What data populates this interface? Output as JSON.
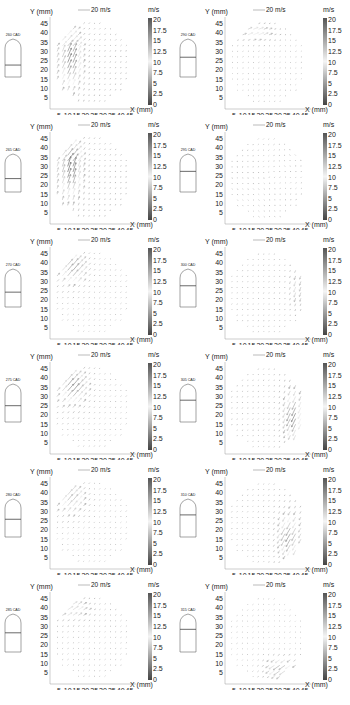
{
  "figure": {
    "axis_labels": {
      "y": "Y (mm)",
      "x": "X (mm)"
    },
    "scale_vector_label": "20 m/s",
    "colorbar": {
      "unit": "m/s",
      "ticks": [
        "20",
        "17.5",
        "15",
        "12.5",
        "10",
        "7.5",
        "5",
        "2.5",
        "0"
      ],
      "range": [
        0,
        20
      ],
      "colors": {
        "top": "#555555",
        "mid": "#f4f4f4",
        "bottom": "#444444"
      }
    },
    "x_ticks": [
      "5",
      "10",
      "15",
      "20",
      "25",
      "30",
      "35",
      "40",
      "45"
    ],
    "y_ticks": [
      "45",
      "40",
      "35",
      "30",
      "25",
      "20",
      "15",
      "10",
      "5"
    ]
  },
  "chart_data": [
    {
      "type": "vector_field",
      "title": "260 CAD",
      "crank_angle": 260,
      "piston_position": 0.55,
      "high_velocity_region": "left side, upward swirl along left wall (x 5-20 mm, y 10-40 mm)",
      "max_velocity_m_s": 18,
      "xlabel": "X (mm)",
      "ylabel": "Y (mm)",
      "xlim": [
        0,
        47
      ],
      "ylim": [
        0,
        47
      ],
      "clim": [
        0,
        20
      ]
    },
    {
      "type": "vector_field",
      "title": "265 CAD",
      "crank_angle": 265,
      "piston_position": 0.6,
      "high_velocity_region": "left side, upward flow along left wall (x 5-20 mm, y 15-42 mm)",
      "max_velocity_m_s": 18,
      "xlabel": "X (mm)",
      "ylabel": "Y (mm)",
      "xlim": [
        0,
        47
      ],
      "ylim": [
        0,
        47
      ],
      "clim": [
        0,
        20
      ]
    },
    {
      "type": "vector_field",
      "title": "270 CAD",
      "crank_angle": 270,
      "piston_position": 0.65,
      "high_velocity_region": "upper-left (x 5-20 mm, y 28-44 mm)",
      "max_velocity_m_s": 16,
      "xlabel": "X (mm)",
      "ylabel": "Y (mm)",
      "xlim": [
        0,
        47
      ],
      "ylim": [
        0,
        47
      ],
      "clim": [
        0,
        20
      ]
    },
    {
      "type": "vector_field",
      "title": "275 CAD",
      "crank_angle": 275,
      "piston_position": 0.7,
      "high_velocity_region": "upper-left diagonal flow (x 5-20 mm, y 25-45 mm)",
      "max_velocity_m_s": 17,
      "xlabel": "X (mm)",
      "ylabel": "Y (mm)",
      "xlim": [
        0,
        47
      ],
      "ylim": [
        0,
        47
      ],
      "clim": [
        0,
        20
      ]
    },
    {
      "type": "vector_field",
      "title": "280 CAD",
      "crank_angle": 280,
      "piston_position": 0.75,
      "high_velocity_region": "upper-left (x 5-18 mm, y 28-44 mm)",
      "max_velocity_m_s": 14,
      "xlabel": "X (mm)",
      "ylabel": "Y (mm)",
      "xlim": [
        0,
        47
      ],
      "ylim": [
        0,
        47
      ],
      "clim": [
        0,
        20
      ]
    },
    {
      "type": "vector_field",
      "title": "285 CAD",
      "crank_angle": 285,
      "piston_position": 0.8,
      "high_velocity_region": "upper-left (x 5-20 mm, y 32-44 mm)",
      "max_velocity_m_s": 12,
      "xlabel": "X (mm)",
      "ylabel": "Y (mm)",
      "xlim": [
        0,
        47
      ],
      "ylim": [
        0,
        47
      ],
      "clim": [
        0,
        20
      ]
    },
    {
      "type": "vector_field",
      "title": "290 CAD",
      "crank_angle": 290,
      "piston_position": 0.82,
      "high_velocity_region": "top-left (x 10-25 mm, y 36-44 mm)",
      "max_velocity_m_s": 12,
      "xlabel": "X (mm)",
      "ylabel": "Y (mm)",
      "xlim": [
        0,
        47
      ],
      "ylim": [
        0,
        47
      ],
      "clim": [
        0,
        20
      ]
    },
    {
      "type": "vector_field",
      "title": "295 CAD",
      "crank_angle": 295,
      "piston_position": 0.85,
      "high_velocity_region": "weak uniform field",
      "max_velocity_m_s": 6,
      "xlabel": "X (mm)",
      "ylabel": "Y (mm)",
      "xlim": [
        0,
        47
      ],
      "ylim": [
        0,
        47
      ],
      "clim": [
        0,
        20
      ]
    },
    {
      "type": "vector_field",
      "title": "300 CAD",
      "crank_angle": 300,
      "piston_position": 0.87,
      "high_velocity_region": "right side (x 38-44 mm, y 20-34 mm)",
      "max_velocity_m_s": 10,
      "xlabel": "X (mm)",
      "ylabel": "Y (mm)",
      "xlim": [
        0,
        47
      ],
      "ylim": [
        0,
        47
      ],
      "clim": [
        0,
        20
      ]
    },
    {
      "type": "vector_field",
      "title": "305 CAD",
      "crank_angle": 305,
      "piston_position": 0.89,
      "high_velocity_region": "right side, downward swirl (x 33-45 mm, y 10-33 mm)",
      "max_velocity_m_s": 17,
      "xlabel": "X (mm)",
      "ylabel": "Y (mm)",
      "xlim": [
        0,
        47
      ],
      "ylim": [
        0,
        47
      ],
      "clim": [
        0,
        20
      ]
    },
    {
      "type": "vector_field",
      "title": "310 CAD",
      "crank_angle": 310,
      "piston_position": 0.9,
      "high_velocity_region": "lower-right (x 30-44 mm, y 8-30 mm)",
      "max_velocity_m_s": 16,
      "xlabel": "X (mm)",
      "ylabel": "Y (mm)",
      "xlim": [
        0,
        47
      ],
      "ylim": [
        0,
        47
      ],
      "clim": [
        0,
        20
      ]
    },
    {
      "type": "vector_field",
      "title": "315 CAD",
      "crank_angle": 315,
      "piston_position": 0.92,
      "high_velocity_region": "bottom-right (x 25-38 mm, y 2-15 mm)",
      "max_velocity_m_s": 15,
      "xlabel": "X (mm)",
      "ylabel": "Y (mm)",
      "xlim": [
        0,
        47
      ],
      "ylim": [
        0,
        47
      ],
      "clim": [
        0,
        20
      ]
    }
  ]
}
